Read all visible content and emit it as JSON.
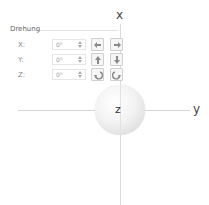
{
  "axes": {
    "x_label": "x",
    "y_label": "y",
    "z_label": "z"
  },
  "rotation_panel": {
    "title": "Drehung",
    "rows": [
      {
        "label": "X:",
        "value": "0°",
        "left_icon": "rotate-left-icon",
        "right_icon": "rotate-right-icon"
      },
      {
        "label": "Y:",
        "value": "0°",
        "left_icon": "rotate-up-icon",
        "right_icon": "rotate-down-icon"
      },
      {
        "label": "Z:",
        "value": "0°",
        "left_icon": "rotate-counterclockwise-icon",
        "right_icon": "rotate-clockwise-icon"
      }
    ]
  },
  "colors": {
    "axis_line": "#d4d4d4",
    "button_border": "#cfcfcf",
    "icon": "#8a8a8a"
  }
}
